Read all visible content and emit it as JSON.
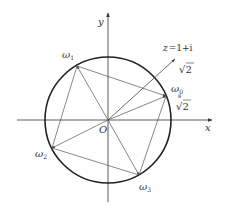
{
  "diagram": {
    "axes": {
      "x_label": "x",
      "y_label": "y",
      "origin_label": "O"
    },
    "vector": {
      "label": "z = 1+i",
      "label_z": "z",
      "label_eq": "=",
      "label_expr": "1+i",
      "modulus_label": "√2",
      "modulus_radical": "√",
      "modulus_radicand": "2"
    },
    "circle": {
      "radius_label_index": "8",
      "radius_label_radical": "√",
      "radius_label_radicand": "2",
      "radius_label": "⁸√2"
    },
    "roots": [
      {
        "name": "ω0",
        "symbol": "ω",
        "subscript": "0"
      },
      {
        "name": "ω1",
        "symbol": "ω",
        "subscript": "1"
      },
      {
        "name": "ω2",
        "symbol": "ω",
        "subscript": "2"
      },
      {
        "name": "ω3",
        "symbol": "ω",
        "subscript": "3"
      }
    ],
    "colors": {
      "circle": "#222222",
      "lines": "#555555",
      "axes": "#333333",
      "text": "#333333"
    }
  }
}
